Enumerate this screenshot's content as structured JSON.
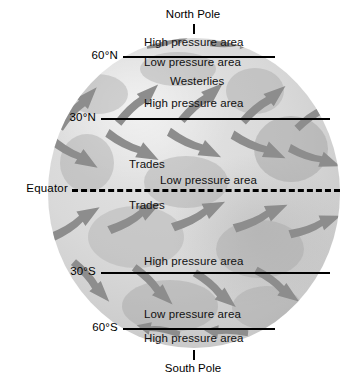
{
  "diagram": {
    "type": "earth-wind-belts",
    "colors": {
      "globe_light": "#e4e4e4",
      "globe_mid": "#d9d9d9",
      "globe_dark": "#bdbdbd",
      "arrow": "#8d8d8d",
      "line": "#000000",
      "background": "#ffffff"
    }
  },
  "poles": {
    "north": "North Pole",
    "south": "South Pole"
  },
  "latitudes": [
    {
      "label": "60°N",
      "y": 56
    },
    {
      "label": "30°N",
      "y": 118
    },
    {
      "label": "Equator",
      "y": 189
    },
    {
      "label": "30°S",
      "y": 272
    },
    {
      "label": "60°S",
      "y": 328
    }
  ],
  "bands": [
    {
      "label": "High pressure area",
      "y": 44,
      "x": 142,
      "zone": "polar-high-north"
    },
    {
      "label": "Low pressure area",
      "y": 62,
      "x": 142,
      "zone": "subpolar-low-north"
    },
    {
      "label": "Westerlies",
      "y": 80,
      "x": 168,
      "zone": "westerlies-north"
    },
    {
      "label": "High pressure area",
      "y": 102,
      "x": 142,
      "zone": "subtropical-high-north"
    },
    {
      "label": "Trades",
      "y": 163,
      "x": 130,
      "zone": "trades-north"
    },
    {
      "label": "Low pressure area",
      "y": 178,
      "x": 160,
      "zone": "equatorial-low"
    },
    {
      "label": "Trades",
      "y": 204,
      "x": 130,
      "zone": "trades-south"
    },
    {
      "label": "High pressure area",
      "y": 260,
      "x": 142,
      "zone": "subtropical-high-south"
    },
    {
      "label": "Low pressure area",
      "y": 313,
      "x": 142,
      "zone": "subpolar-low-south"
    },
    {
      "label": "High pressure area",
      "y": 338,
      "x": 142,
      "zone": "polar-high-south"
    }
  ],
  "wind_arrows": {
    "westerlies_north_direction": "up-right (northeast)",
    "trades_north_direction": "down-left (southwest)",
    "trades_south_direction": "up-left (northwest)",
    "westerlies_south_direction": "down-right (southeast)",
    "polar_north_direction": "down-left",
    "polar_south_direction": "up-left"
  }
}
